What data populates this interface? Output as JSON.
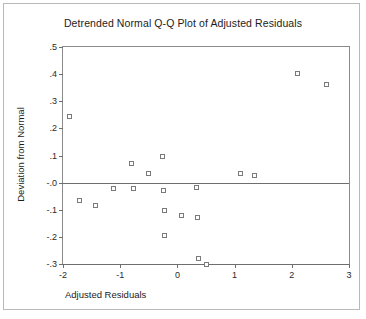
{
  "chart_data": {
    "type": "scatter",
    "title": "Detrended Normal Q-Q Plot of Adjusted Residuals",
    "xlabel": "Adjusted Residuals",
    "ylabel": "Deviation from Normal",
    "xlim": [
      -2,
      3
    ],
    "ylim": [
      -0.3,
      0.5
    ],
    "grid": false,
    "legend": null,
    "xticks": [
      -2,
      -1,
      0,
      1,
      2,
      3
    ],
    "xtick_labels": [
      "-2",
      "-1",
      "0",
      "1",
      "2",
      "3"
    ],
    "yticks": [
      0.5,
      0.4,
      0.3,
      0.2,
      0.1,
      0.0,
      -0.1,
      -0.2,
      -0.3
    ],
    "ytick_labels": [
      ".5",
      ".4",
      ".3",
      ".2",
      ".1",
      "-.0",
      "-.1",
      "-.2",
      "-.3"
    ],
    "reference_line": {
      "y": 0.0,
      "orientation": "horizontal"
    },
    "marker": {
      "shape": "open-square",
      "edge_color": "#7a7a7a",
      "fill_color": "#ffffff",
      "size_px": 5
    },
    "points": [
      {
        "x": -1.88,
        "y": 0.245
      },
      {
        "x": -1.72,
        "y": -0.065
      },
      {
        "x": -1.43,
        "y": -0.085
      },
      {
        "x": -1.11,
        "y": -0.02
      },
      {
        "x": -0.8,
        "y": 0.07
      },
      {
        "x": -0.76,
        "y": -0.02
      },
      {
        "x": -0.5,
        "y": 0.035
      },
      {
        "x": -0.26,
        "y": 0.098
      },
      {
        "x": -0.24,
        "y": -0.03
      },
      {
        "x": -0.22,
        "y": -0.103
      },
      {
        "x": -0.23,
        "y": -0.195
      },
      {
        "x": 0.07,
        "y": -0.122
      },
      {
        "x": 0.33,
        "y": -0.018
      },
      {
        "x": 0.36,
        "y": -0.13
      },
      {
        "x": 0.37,
        "y": -0.28
      },
      {
        "x": 0.5,
        "y": -0.303
      },
      {
        "x": 1.1,
        "y": 0.033
      },
      {
        "x": 1.35,
        "y": 0.028
      },
      {
        "x": 2.1,
        "y": 0.402
      },
      {
        "x": 2.6,
        "y": 0.362
      }
    ]
  }
}
